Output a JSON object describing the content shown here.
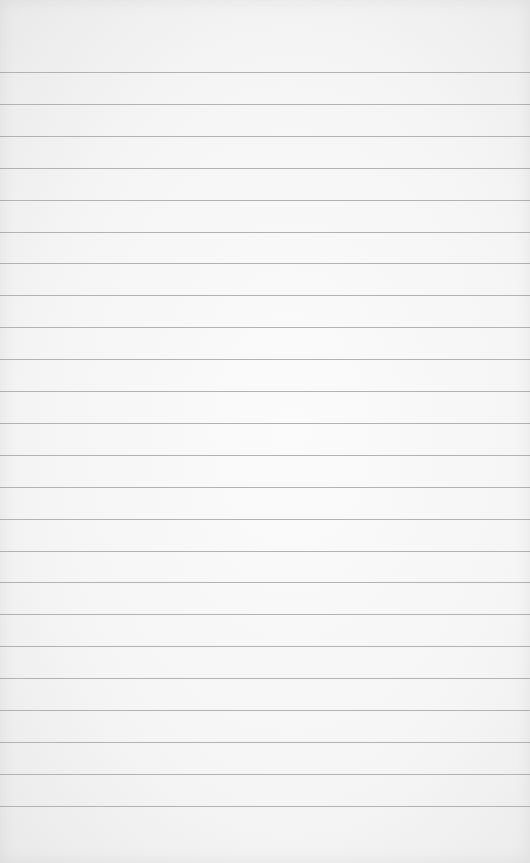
{
  "paper": {
    "type": "lined-paper",
    "background_color": "#f5f5f5",
    "line_color": "#b3b3b3",
    "first_line_y": 72,
    "line_spacing": 31.9,
    "line_count": 24,
    "text": ""
  }
}
